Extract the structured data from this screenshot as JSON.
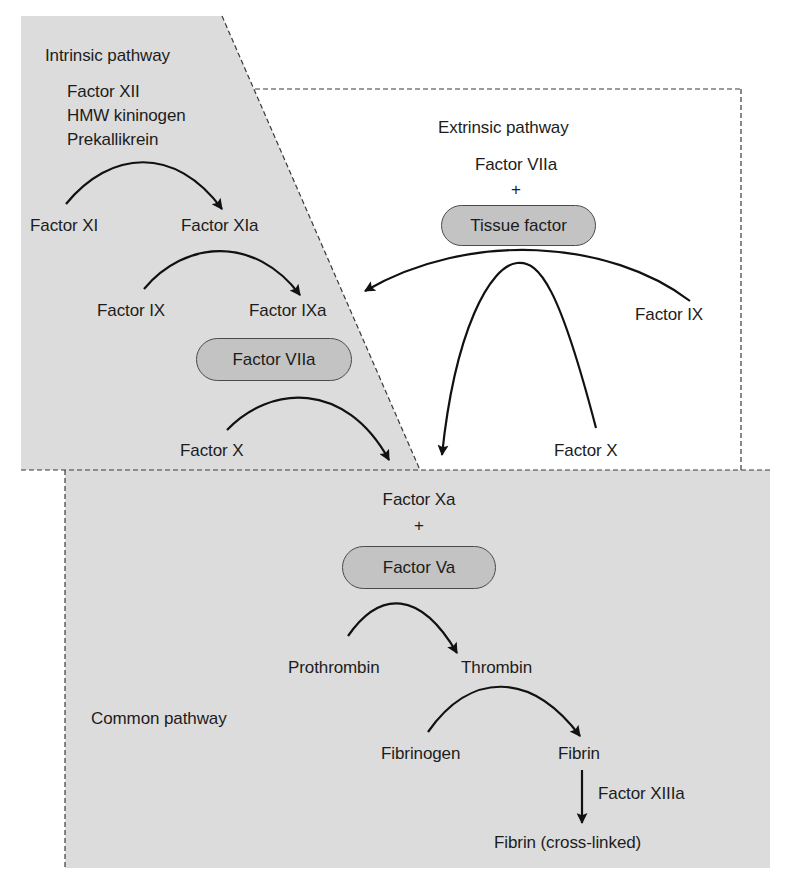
{
  "diagram": {
    "colors": {
      "panel_fill": "#dcdcdc",
      "pill_fill": "#c3c3c3",
      "border_dash": "#3a3a3a",
      "arrow": "#111111",
      "text": "#1c1c1c"
    },
    "intrinsic": {
      "heading": "Intrinsic pathway",
      "initiators": [
        "Factor XII",
        "HMW kininogen",
        "Prekallikrein"
      ],
      "step1": {
        "from": "Factor XI",
        "to": "Factor XIa"
      },
      "step2": {
        "from": "Factor IX",
        "to": "Factor IXa"
      },
      "cofactor": "Factor VIIa",
      "step3": {
        "from": "Factor X"
      }
    },
    "extrinsic": {
      "heading": "Extrinsic pathway",
      "complex_top": "Factor VIIa",
      "plus": "+",
      "cofactor": "Tissue factor",
      "substrate_ix": "Factor IX",
      "substrate_x": "Factor X"
    },
    "common": {
      "heading": "Common pathway",
      "complex_top": "Factor Xa",
      "plus": "+",
      "cofactor": "Factor Va",
      "step1": {
        "from": "Prothrombin",
        "to": "Thrombin"
      },
      "step2": {
        "from": "Fibrinogen",
        "to": "Fibrin"
      },
      "step3": {
        "enzyme": "Factor XIIIa",
        "to": "Fibrin (cross-linked)"
      }
    }
  }
}
